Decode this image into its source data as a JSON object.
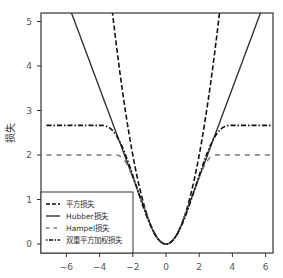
{
  "chart_data": {
    "type": "line",
    "title": "",
    "xlabel": "",
    "ylabel": "损失",
    "xlim": [
      -7.2,
      6.4
    ],
    "ylim": [
      -0.05,
      5.2
    ],
    "xticks": [
      -6,
      -4,
      -2,
      0,
      2,
      4,
      6
    ],
    "yticks": [
      0,
      1,
      2,
      3,
      4,
      5
    ],
    "xtick_labels": [
      "−6",
      "−4",
      "−2",
      "0",
      "2",
      "4",
      "6"
    ],
    "ytick_labels": [
      "0",
      "1",
      "2",
      "3",
      "4",
      "5"
    ],
    "grid": false,
    "legend_position": "lower left",
    "series": [
      {
        "name": "平方损失",
        "style": "dashed",
        "color": "#111111",
        "formula": "0.5*t^2",
        "x": [
          -3.2,
          -3,
          -2,
          -1,
          0,
          1,
          2,
          3,
          3.2
        ],
        "values": [
          5.12,
          4.5,
          2.0,
          0.5,
          0.0,
          0.5,
          2.0,
          4.5,
          5.12
        ]
      },
      {
        "name": "Hubber损失",
        "style": "solid",
        "color": "#333333",
        "formula": "|t|<=1 ? 0.5*t^2 : |t|-0.5",
        "x": [
          -5.7,
          -5,
          -4,
          -3,
          -2,
          -1,
          0,
          1,
          2,
          3,
          4,
          5,
          5.7
        ],
        "values": [
          5.2,
          4.5,
          3.5,
          2.5,
          1.5,
          0.5,
          0.0,
          0.5,
          1.5,
          2.5,
          3.5,
          4.5,
          5.2
        ]
      },
      {
        "name": "Hampel损失",
        "style": "dashed-gray",
        "color": "#777777",
        "x": [
          -7.2,
          -6,
          -4,
          -3,
          -2.5,
          -2,
          -1,
          0,
          1,
          2,
          2.5,
          3,
          4,
          6,
          6.4
        ],
        "values": [
          2.0,
          2.0,
          2.0,
          2.0,
          1.92,
          1.5,
          0.5,
          0.0,
          0.5,
          1.5,
          1.92,
          2.0,
          2.0,
          2.0,
          2.0
        ]
      },
      {
        "name": "双重平方加权损失",
        "style": "dash-dot",
        "color": "#111111",
        "formula": "|t|<=c ? c^2/6*(1-(1-(t/c)^2)^3) : c^2/6, c=4",
        "x": [
          -7.2,
          -6,
          -4,
          -3,
          -2,
          -1,
          0,
          1,
          2,
          3,
          4,
          6,
          6.4
        ],
        "values": [
          2.67,
          2.67,
          2.67,
          2.56,
          1.54,
          0.47,
          0.0,
          0.47,
          1.54,
          2.56,
          2.67,
          2.67,
          2.67
        ]
      }
    ]
  },
  "legend": {
    "items": [
      {
        "label": "平方损失"
      },
      {
        "label": "Hubber损失"
      },
      {
        "label": "Hampel损失"
      },
      {
        "label": "双重平方加权损失"
      }
    ]
  },
  "axes": {
    "ylabel": "损失",
    "xtick_labels": [
      "−6",
      "−4",
      "−2",
      "0",
      "2",
      "4",
      "6"
    ],
    "ytick_labels": [
      "0",
      "1",
      "2",
      "3",
      "4",
      "5"
    ]
  }
}
